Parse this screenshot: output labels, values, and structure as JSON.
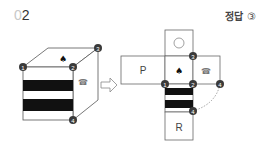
{
  "header": {
    "question_number_prefix": "0",
    "question_number_suffix": "2",
    "answer_label": "정답",
    "answer_value": "③"
  },
  "cube": {
    "top_symbol": "♠",
    "right_symbol": "☎",
    "front_pattern": "black-white-black stripes",
    "vertex_labels": [
      "1",
      "2",
      "3",
      "4"
    ]
  },
  "arrow": {
    "symbol": "⇨"
  },
  "net": {
    "faces": [
      {
        "id": "top",
        "symbol": "○"
      },
      {
        "id": "left",
        "symbol": "P"
      },
      {
        "id": "center",
        "symbol": "♠"
      },
      {
        "id": "right",
        "symbol": "☎"
      },
      {
        "id": "below",
        "symbol": "stripes"
      },
      {
        "id": "bottom",
        "symbol": "R"
      }
    ],
    "vertex_labels": {
      "v3": "3",
      "v1": "1",
      "v2": "2",
      "v4a": "4",
      "v4b": "4"
    }
  },
  "colors": {
    "line": "#555555",
    "stripe": "#111111",
    "marker": "#3a3a3a",
    "marker_text": "#ffffff"
  }
}
